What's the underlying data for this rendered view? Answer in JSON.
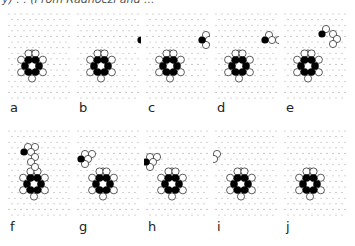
{
  "figure": {
    "caption_fragment": "y) . . (From Radnóczi and ...",
    "colors": {
      "grid_dot": "#9a9a9a",
      "filled_atom": "#000000",
      "open_atom_stroke": "#333333",
      "open_atom_fill": "#ffffff",
      "label": "#222222"
    },
    "panels": [
      {
        "label": "a",
        "adatom": null
      },
      {
        "label": "b",
        "adatom": {
          "dx": 40,
          "dy": -26,
          "neighbors": [
            [
              4,
              -5
            ],
            [
              7,
              0
            ],
            [
              4,
              5
            ],
            [
              14,
              0
            ]
          ]
        }
      },
      {
        "label": "c",
        "adatom": {
          "dx": 32,
          "dy": -26,
          "neighbors": [
            [
              4,
              -5
            ],
            [
              7,
              0
            ],
            [
              4,
              5
            ]
          ]
        }
      },
      {
        "label": "d",
        "adatom": {
          "dx": 26,
          "dy": -26,
          "neighbors": [
            [
              4,
              -5
            ],
            [
              7,
              0
            ],
            [
              14,
              0
            ]
          ]
        }
      },
      {
        "label": "e",
        "adatom": {
          "dx": 14,
          "dy": -32,
          "neighbors": [
            [
              4,
              -5
            ],
            [
              11,
              0
            ],
            [
              15,
              5
            ],
            [
              11,
              10
            ]
          ]
        }
      },
      {
        "label": "f",
        "adatom": {
          "dx": -10,
          "dy": -32,
          "neighbors": [
            [
              4,
              -5
            ],
            [
              11,
              -5
            ],
            [
              7,
              0
            ],
            [
              11,
              5
            ],
            [
              7,
              10
            ],
            [
              11,
              15
            ]
          ]
        }
      },
      {
        "label": "g",
        "adatom": {
          "dx": -22,
          "dy": -25,
          "neighbors": [
            [
              4,
              -5
            ],
            [
              11,
              -5
            ],
            [
              7,
              0
            ],
            [
              4,
              5
            ]
          ]
        }
      },
      {
        "label": "h",
        "adatom": {
          "dx": -26,
          "dy": -22,
          "neighbors": [
            [
              4,
              -5
            ],
            [
              11,
              -5
            ],
            [
              7,
              0
            ],
            [
              4,
              5
            ]
          ]
        }
      },
      {
        "label": "i",
        "adatom": null,
        "open_pair": [
          [
            -24,
            -30
          ],
          [
            -27,
            -25
          ]
        ]
      },
      {
        "label": "j",
        "adatom": null
      }
    ]
  }
}
